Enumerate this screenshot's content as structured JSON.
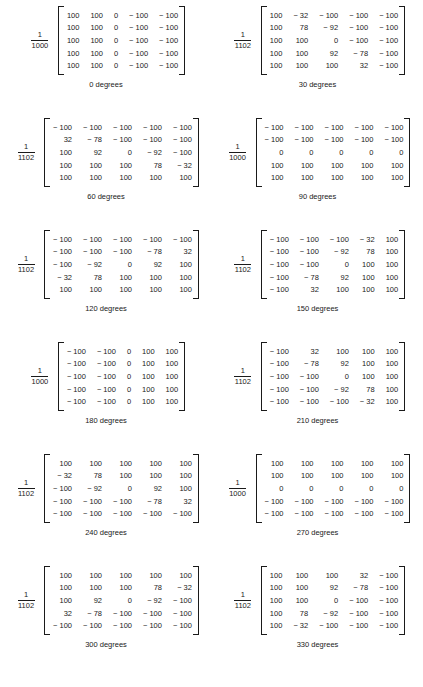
{
  "figure": {
    "columns": 2,
    "rows": 6,
    "text_color": "#1a1a1a",
    "background": "#ffffff",
    "bottom_caption": ""
  },
  "chart_data": {
    "type": "table",
    "title": "",
    "matrix_rows": 5,
    "matrix_cols": 5,
    "matrices": [
      {
        "angle_label": "0 degrees",
        "scale_numerator": "1",
        "scale_denominator": "1000",
        "values": [
          [
            "100",
            "100",
            "0",
            "− 100",
            "− 100"
          ],
          [
            "100",
            "100",
            "0",
            "− 100",
            "− 100"
          ],
          [
            "100",
            "100",
            "0",
            "− 100",
            "− 100"
          ],
          [
            "100",
            "100",
            "0",
            "− 100",
            "− 100"
          ],
          [
            "100",
            "100",
            "0",
            "− 100",
            "− 100"
          ]
        ]
      },
      {
        "angle_label": "30 degrees",
        "scale_numerator": "1",
        "scale_denominator": "1102",
        "values": [
          [
            "100",
            "− 32",
            "− 100",
            "− 100",
            "− 100"
          ],
          [
            "100",
            "78",
            "− 92",
            "− 100",
            "− 100"
          ],
          [
            "100",
            "100",
            "0",
            "− 100",
            "− 100"
          ],
          [
            "100",
            "100",
            "92",
            "− 78",
            "− 100"
          ],
          [
            "100",
            "100",
            "100",
            "32",
            "− 100"
          ]
        ]
      },
      {
        "angle_label": "60 degrees",
        "scale_numerator": "1",
        "scale_denominator": "1102",
        "values": [
          [
            "− 100",
            "− 100",
            "− 100",
            "− 100",
            "− 100"
          ],
          [
            "32",
            "− 78",
            "− 100",
            "− 100",
            "− 100"
          ],
          [
            "100",
            "92",
            "0",
            "− 92",
            "− 100"
          ],
          [
            "100",
            "100",
            "100",
            "78",
            "− 32"
          ],
          [
            "100",
            "100",
            "100",
            "100",
            "100"
          ]
        ]
      },
      {
        "angle_label": "90 degrees",
        "scale_numerator": "1",
        "scale_denominator": "1000",
        "values": [
          [
            "− 100",
            "− 100",
            "− 100",
            "− 100",
            "− 100"
          ],
          [
            "− 100",
            "− 100",
            "− 100",
            "− 100",
            "− 100"
          ],
          [
            "0",
            "0",
            "0",
            "0",
            "0"
          ],
          [
            "100",
            "100",
            "100",
            "100",
            "100"
          ],
          [
            "100",
            "100",
            "100",
            "100",
            "100"
          ]
        ]
      },
      {
        "angle_label": "120 degrees",
        "scale_numerator": "1",
        "scale_denominator": "1102",
        "values": [
          [
            "− 100",
            "− 100",
            "− 100",
            "− 100",
            "− 100"
          ],
          [
            "− 100",
            "− 100",
            "− 100",
            "− 78",
            "32"
          ],
          [
            "− 100",
            "− 92",
            "0",
            "92",
            "100"
          ],
          [
            "− 32",
            "78",
            "100",
            "100",
            "100"
          ],
          [
            "100",
            "100",
            "100",
            "100",
            "100"
          ]
        ]
      },
      {
        "angle_label": "150 degrees",
        "scale_numerator": "1",
        "scale_denominator": "1102",
        "values": [
          [
            "− 100",
            "− 100",
            "− 100",
            "− 32",
            "100"
          ],
          [
            "− 100",
            "− 100",
            "− 92",
            "78",
            "100"
          ],
          [
            "− 100",
            "− 100",
            "0",
            "100",
            "100"
          ],
          [
            "− 100",
            "− 78",
            "92",
            "100",
            "100"
          ],
          [
            "− 100",
            "32",
            "100",
            "100",
            "100"
          ]
        ]
      },
      {
        "angle_label": "180 degrees",
        "scale_numerator": "1",
        "scale_denominator": "1000",
        "values": [
          [
            "− 100",
            "− 100",
            "0",
            "100",
            "100"
          ],
          [
            "− 100",
            "− 100",
            "0",
            "100",
            "100"
          ],
          [
            "− 100",
            "− 100",
            "0",
            "100",
            "100"
          ],
          [
            "− 100",
            "− 100",
            "0",
            "100",
            "100"
          ],
          [
            "− 100",
            "− 100",
            "0",
            "100",
            "100"
          ]
        ]
      },
      {
        "angle_label": "210 degrees",
        "scale_numerator": "1",
        "scale_denominator": "1102",
        "values": [
          [
            "− 100",
            "32",
            "100",
            "100",
            "100"
          ],
          [
            "− 100",
            "− 78",
            "92",
            "100",
            "100"
          ],
          [
            "− 100",
            "− 100",
            "0",
            "100",
            "100"
          ],
          [
            "− 100",
            "− 100",
            "− 92",
            "78",
            "100"
          ],
          [
            "− 100",
            "− 100",
            "− 100",
            "− 32",
            "100"
          ]
        ]
      },
      {
        "angle_label": "240 degrees",
        "scale_numerator": "1",
        "scale_denominator": "1102",
        "values": [
          [
            "100",
            "100",
            "100",
            "100",
            "100"
          ],
          [
            "− 32",
            "78",
            "100",
            "100",
            "100"
          ],
          [
            "− 100",
            "− 92",
            "0",
            "92",
            "100"
          ],
          [
            "− 100",
            "− 100",
            "− 100",
            "− 78",
            "32"
          ],
          [
            "− 100",
            "− 100",
            "− 100",
            "− 100",
            "− 100"
          ]
        ]
      },
      {
        "angle_label": "270 degrees",
        "scale_numerator": "1",
        "scale_denominator": "1000",
        "values": [
          [
            "100",
            "100",
            "100",
            "100",
            "100"
          ],
          [
            "100",
            "100",
            "100",
            "100",
            "100"
          ],
          [
            "0",
            "0",
            "0",
            "0",
            "0"
          ],
          [
            "− 100",
            "− 100",
            "− 100",
            "− 100",
            "− 100"
          ],
          [
            "− 100",
            "− 100",
            "− 100",
            "− 100",
            "− 100"
          ]
        ]
      },
      {
        "angle_label": "300 degrees",
        "scale_numerator": "1",
        "scale_denominator": "1102",
        "values": [
          [
            "100",
            "100",
            "100",
            "100",
            "100"
          ],
          [
            "100",
            "100",
            "100",
            "78",
            "− 32"
          ],
          [
            "100",
            "92",
            "0",
            "− 92",
            "− 100"
          ],
          [
            "32",
            "− 78",
            "− 100",
            "− 100",
            "− 100"
          ],
          [
            "− 100",
            "− 100",
            "− 100",
            "− 100",
            "− 100"
          ]
        ]
      },
      {
        "angle_label": "330 degrees",
        "scale_numerator": "1",
        "scale_denominator": "1102",
        "values": [
          [
            "100",
            "100",
            "100",
            "32",
            "− 100"
          ],
          [
            "100",
            "100",
            "92",
            "− 78",
            "− 100"
          ],
          [
            "100",
            "100",
            "0",
            "− 100",
            "− 100"
          ],
          [
            "100",
            "78",
            "− 92",
            "− 100",
            "− 100"
          ],
          [
            "100",
            "− 32",
            "− 100",
            "− 100",
            "− 100"
          ]
        ]
      }
    ]
  }
}
